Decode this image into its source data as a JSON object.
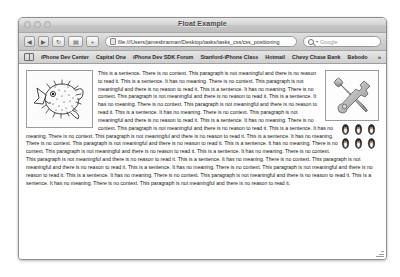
{
  "window": {
    "title": "Float Example",
    "traffic_lights": [
      "close",
      "minimize",
      "zoom"
    ]
  },
  "toolbar": {
    "back_label": "◀",
    "forward_label": "▶",
    "reload_label": "↻",
    "reader_label": "▤",
    "add_label": "+",
    "url_value": "file:///Users/jamesbrannan/Desktop/tasks/tasks_css/css_positioning",
    "search_placeholder": "Google",
    "search_caret": "▾"
  },
  "bookmarks": {
    "items": [
      {
        "label": "iPhone Dev Center"
      },
      {
        "label": "Capital One"
      },
      {
        "label": "iPhone Dev SDK Forum"
      },
      {
        "label": "Stanford-iPhone Class"
      },
      {
        "label": "Hotmail"
      },
      {
        "label": "Chevy Chase Bank"
      },
      {
        "label": "Bebodo"
      }
    ],
    "overflow_label": "»"
  },
  "page": {
    "fish_image_alt": "pufferfish",
    "tools_image_alt": "wrench-and-screwdriver",
    "penguin_image_alt": "penguin",
    "penguin_rows": 2,
    "penguins_per_row": 3,
    "paragraph_1": "This is a sentence. There is no context. This paragraph is not meaningful and there is no reason to read it. This is a sentence. It has no meaning. There is no context. This paragraph is not meaningful and there is no reason to read it. This is a sentence. It has no meaning. There is no context. This paragraph is not meaningful and there is no reason to read it. This is a sentence. It has no meaning. There is no context. This paragraph is not meaningful and there is no reason to read it. This is a sentence. It has no meaning. There is no context. This paragraph is not meaningful and there is no reason to read it. This is a sentence. It has no meaning. There is no context. This paragraph is not meaningful and there is no reason to read it. This is a sentence. It has no meaning. There is no context. This paragraph is not meaningful and there is no reason to read it. This is a sentence. It has no meaning. There is no context. This paragraph is not meaningful and there is no reason to read it.",
    "paragraph_2": "This is a sentence. It has no meaning. There is no context. This paragraph is not meaningful and there is no reason to read it. This is a sentence. It has no meaning. There is no context. This paragraph is not meaningful and there is no reason to read it. This is a sentence. It has no meaning. There is no context. This paragraph is not meaningful and there is no reason to read it. This is a sentence. It has no meaning. There is no context. This paragraph is not meaningful and there is no reason to read it. This is a sentence. It has no meaning. There is no context. This paragraph is not meaningful and there is no reason to read it. This is a sentence. It has no meaning. There is no context. This paragraph is not meaningful and there is no reason to read it."
  },
  "colors": {
    "page_background": "#ffffff",
    "window_chrome": "#d0d0d0",
    "text": "#141414",
    "border": "#9c9c9c"
  }
}
